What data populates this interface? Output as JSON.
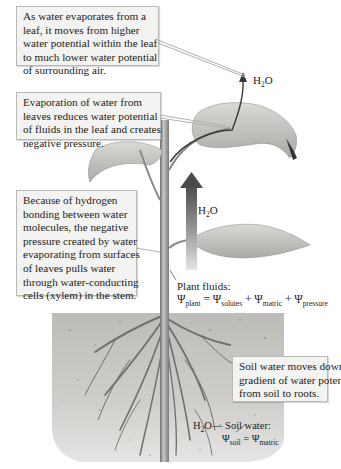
{
  "figure": {
    "type": "plant water transport diagram",
    "callouts": [
      {
        "id": "leaf-evaporation",
        "lines": [
          "As water evaporates from a",
          "leaf, it moves from higher",
          "water potential within the leaf",
          "to much lower water potential",
          "of surrounding air."
        ]
      },
      {
        "id": "negative-pressure",
        "lines": [
          "Evaporation of water from",
          "leaves reduces water potential",
          "of fluids in the leaf and creates",
          "negative pressure."
        ]
      },
      {
        "id": "hydrogen-bonding",
        "lines": [
          "Because of hydrogen",
          "bonding between water",
          "molecules, the negative",
          "pressure created by water",
          "evaporating from surfaces",
          "of leaves pulls water",
          "through water-conducting",
          "cells (xylem) in the stem."
        ]
      },
      {
        "id": "soil-gradient",
        "lines": [
          "Soil water moves down a",
          "gradient of water potential",
          "from soil to roots."
        ]
      }
    ],
    "labels": {
      "h2o_top": {
        "main": "H",
        "sub": "2",
        "tail": "O"
      },
      "h2o_stem": {
        "main": "H",
        "sub": "2",
        "tail": "O"
      },
      "h2o_soil": {
        "main": "H",
        "sub": "2",
        "tail": "O"
      },
      "plant_fluids": {
        "title": "Plant fluids:",
        "psi": "Ψ",
        "lhs_sub": "plant",
        "eq": " = ",
        "terms": [
          "solutes",
          "matric",
          "pressure"
        ],
        "plus": " + "
      },
      "soil_water": {
        "title": "— Soil water:",
        "psi": "Ψ",
        "lhs_sub": "soil",
        "eq": " = ",
        "rhs_sub": "matric"
      }
    },
    "colors": {
      "callout_bg": "#f3f3f1",
      "callout_border": "#b9b9b6",
      "soil": "#c9c8c4",
      "leaf": "#cfcfcc",
      "stem": "#9a9a98",
      "arrow_dark": "#4a4a4a"
    }
  }
}
